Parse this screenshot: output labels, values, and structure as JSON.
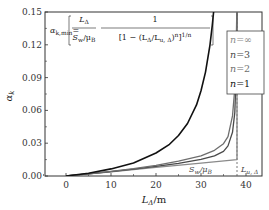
{
  "chart_data": {
    "type": "line",
    "title": "",
    "xlabel": "L_Δ/m",
    "ylabel": "α_k",
    "xlim": [
      -5,
      43
    ],
    "ylim": [
      0,
      0.15
    ],
    "x_ticks": [
      0,
      10,
      20,
      30,
      40
    ],
    "y_ticks": [
      0.0,
      0.03,
      0.06,
      0.09,
      0.12,
      0.15
    ],
    "x_tick_labels": [
      "0",
      "10",
      "20",
      "30",
      "40"
    ],
    "y_tick_labels": [
      "0.00",
      "0.03",
      "0.06",
      "0.09",
      "0.12",
      "0.15"
    ],
    "grid": false,
    "legend_position": "upper right",
    "formula": {
      "lhs": "α",
      "lhs_sub": "k,min",
      "eq": "=",
      "num1": "L",
      "num1_sub": "Δ",
      "den1": "S",
      "den1_sub": "w",
      "den1_rest": "/μ",
      "den1_rest_sub": "B",
      "num2": "1",
      "den2": "[1 − (L",
      "den2_sub": "Δ",
      "den2_mid": "/L",
      "den2_mid_sub": "u, Δ",
      "den2_end": ")",
      "den2_sup": "n",
      "den2_tail": "]",
      "den2_tail_sup": "1/n"
    },
    "annotations": [
      {
        "text": "S",
        "sub": "w",
        "rest": "/μ",
        "rest_sub": "B",
        "x": 30,
        "y": 0.003
      },
      {
        "text": "L",
        "sub": "u, Δ",
        "x": 40,
        "y": 0.003
      }
    ],
    "vertical_marker": {
      "x": 38,
      "style": "dashed",
      "label": "L_u,Δ"
    },
    "series": [
      {
        "name": "n=∞",
        "label": "n=∞",
        "color": "#8a8a8a",
        "width": 1.4,
        "points": [
          [
            0,
            0
          ],
          [
            10,
            0.0039
          ],
          [
            20,
            0.0079
          ],
          [
            30,
            0.0118
          ],
          [
            38,
            0.015
          ],
          [
            38,
            0.15
          ]
        ]
      },
      {
        "name": "n=3",
        "label": "n=3",
        "color": "#4a4a4a",
        "width": 1.3,
        "points": [
          [
            0,
            0
          ],
          [
            5,
            0.002
          ],
          [
            10,
            0.004
          ],
          [
            15,
            0.0062
          ],
          [
            20,
            0.0088
          ],
          [
            25,
            0.0115
          ],
          [
            30,
            0.0152
          ],
          [
            33,
            0.0185
          ],
          [
            35,
            0.0225
          ],
          [
            36,
            0.0275
          ],
          [
            37,
            0.04
          ],
          [
            37.5,
            0.058
          ],
          [
            37.8,
            0.09
          ],
          [
            38,
            0.15
          ]
        ]
      },
      {
        "name": "n=2",
        "label": "n=2",
        "color": "#6e6e6e",
        "width": 1.3,
        "points": [
          [
            0,
            0
          ],
          [
            5,
            0.002
          ],
          [
            10,
            0.0043
          ],
          [
            15,
            0.0068
          ],
          [
            20,
            0.0098
          ],
          [
            25,
            0.0135
          ],
          [
            30,
            0.0185
          ],
          [
            33,
            0.0235
          ],
          [
            35,
            0.0295
          ],
          [
            36,
            0.036
          ],
          [
            37,
            0.055
          ],
          [
            37.5,
            0.08
          ],
          [
            37.8,
            0.115
          ],
          [
            37.95,
            0.15
          ]
        ]
      },
      {
        "name": "n=1",
        "label": "n=1",
        "color": "#111111",
        "width": 1.6,
        "points": [
          [
            0,
            0
          ],
          [
            5,
            0.0025
          ],
          [
            10,
            0.0065
          ],
          [
            15,
            0.012
          ],
          [
            20,
            0.021
          ],
          [
            23,
            0.029
          ],
          [
            25,
            0.037
          ],
          [
            27,
            0.048
          ],
          [
            29,
            0.065
          ],
          [
            30,
            0.078
          ],
          [
            31,
            0.095
          ],
          [
            32,
            0.12
          ],
          [
            32.5,
            0.138
          ],
          [
            32.8,
            0.15
          ]
        ]
      }
    ]
  }
}
